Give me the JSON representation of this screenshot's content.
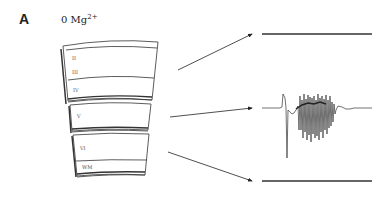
{
  "figure": {
    "panel_letter": "A",
    "condition": {
      "prefix": "0 Mg",
      "superscript": "2+"
    },
    "slab_top_labels": [
      "II",
      "III",
      "IV"
    ],
    "slab_middle_labels": [
      "V"
    ],
    "slab_bottom_labels": [
      "VI",
      "WM"
    ],
    "traces": [
      {
        "name": "top-trace",
        "description": "flat baseline"
      },
      {
        "name": "middle-trace",
        "description": "burst of oscillatory activity"
      },
      {
        "name": "bottom-trace",
        "description": "flat baseline"
      }
    ]
  }
}
